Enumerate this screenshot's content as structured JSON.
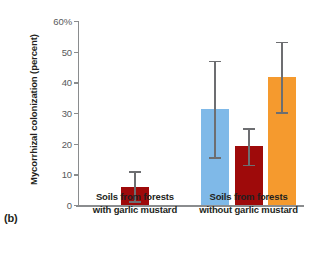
{
  "figure": {
    "panel_label": "(b)"
  },
  "chart_data": {
    "type": "bar",
    "title": "",
    "xlabel": "",
    "ylabel": "Mycorrhizal colonization (percent)",
    "ylim": [
      0,
      60
    ],
    "yticks": [
      0,
      10,
      20,
      30,
      40,
      50,
      60
    ],
    "ytick_labels": [
      "0",
      "10",
      "20",
      "30",
      "40",
      "50",
      "60%"
    ],
    "grid": false,
    "legend": "none",
    "categories": [
      "Soils from forests with garlic mustard",
      "Soils from forests without garlic mustard"
    ],
    "category_lines": [
      [
        "Soils from forests",
        "with garlic mustard"
      ],
      [
        "Soils from forests",
        "without garlic mustard"
      ]
    ],
    "colors": {
      "blue": "#7fb9e8",
      "dark_red": "#9e0a0a",
      "orange": "#f59a2e",
      "axis": "#8a8c8e",
      "error": "#6d6e71"
    },
    "bars": [
      {
        "group": 0,
        "series": "dark_red",
        "color": "#9e0a0a",
        "value": 5.8,
        "error_low": 1.2,
        "error_high": 11.0,
        "x_left_pct": 19.0,
        "width_pct": 12.4
      },
      {
        "group": 1,
        "series": "blue",
        "color": "#7fb9e8",
        "value": 31.2,
        "error_low": 15.5,
        "error_high": 47.0,
        "x_left_pct": 54.4,
        "width_pct": 12.4
      },
      {
        "group": 1,
        "series": "dark_red",
        "color": "#9e0a0a",
        "value": 19.1,
        "error_low": 13.2,
        "error_high": 25.0,
        "x_left_pct": 69.5,
        "width_pct": 12.4
      },
      {
        "group": 1,
        "series": "orange",
        "color": "#f59a2e",
        "value": 41.6,
        "error_low": 30.2,
        "error_high": 53.2,
        "x_left_pct": 84.1,
        "width_pct": 12.4
      }
    ]
  }
}
